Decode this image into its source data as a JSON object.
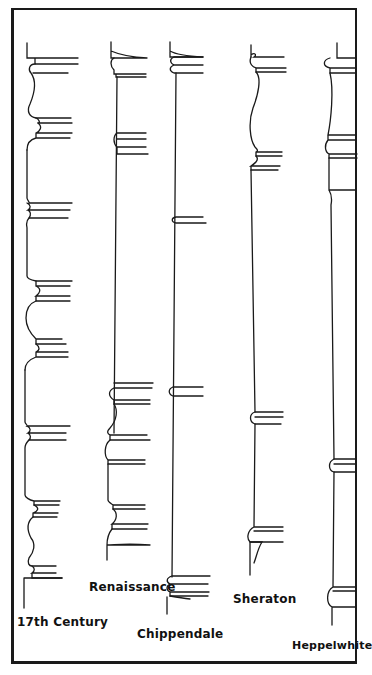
{
  "diagram": {
    "type": "furniture-leg-profiles",
    "line_color": "#1a1a1a",
    "background": "#ffffff",
    "legs": [
      {
        "id": "17th-century",
        "label": "17th Century"
      },
      {
        "id": "renaissance",
        "label": "Renaissance"
      },
      {
        "id": "chippendale",
        "label": "Chippendale"
      },
      {
        "id": "sheraton",
        "label": "Sheraton"
      },
      {
        "id": "heppelwhite",
        "label": "Heppelwhite"
      }
    ]
  }
}
